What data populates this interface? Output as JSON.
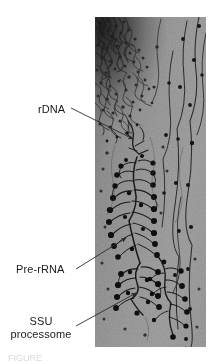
{
  "figure": {
    "kind": "electron-micrograph",
    "caption_partial": "FIGURE"
  },
  "annotations": [
    {
      "id": "rdna",
      "label": "rDNA",
      "leader": {
        "x1": 71,
        "y1": 108,
        "x2": 133,
        "y2": 139
      }
    },
    {
      "id": "pre-rrna",
      "label": "Pre-rRNA",
      "leader": {
        "x1": 76,
        "y1": 269,
        "x2": 126,
        "y2": 238
      }
    },
    {
      "id": "ssu-processome",
      "label_line1": "SSU",
      "label_line2": "processome",
      "leader": {
        "x1": 76,
        "y1": 326,
        "x2": 136,
        "y2": 293
      }
    }
  ],
  "colors": {
    "page_background": "#ffffff",
    "label_text": "#1a1a1a",
    "leader_line": "#2b2b2b",
    "plate_background": "#9c9c9c",
    "plate_dark_mass": "#1e1e1e",
    "particle_dark": "#111111"
  },
  "plate": {
    "left": 95,
    "top": 17,
    "width": 111,
    "height": 330
  }
}
